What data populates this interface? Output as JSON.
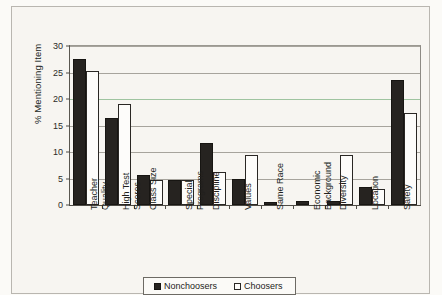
{
  "chart_data": {
    "type": "bar",
    "title": "",
    "xlabel": "",
    "ylabel": "% Mentioning Item",
    "ylim": [
      0,
      30
    ],
    "ytick_labels": [
      "0",
      "5",
      "10",
      "15",
      "20",
      "25",
      "30"
    ],
    "ytick_values": [
      0,
      5,
      10,
      15,
      20,
      25,
      30
    ],
    "grid": true,
    "legend_position": "bottom",
    "categories": [
      "Teacher Quality",
      "High Test Scores",
      "Class Size",
      "Special Programs",
      "Discipline",
      "Values",
      "Same Race",
      "Economic Background",
      "Diversity",
      "Location",
      "Safety"
    ],
    "category_lines": [
      [
        "Teacher",
        "Quality"
      ],
      [
        "High Test",
        "Scores"
      ],
      [
        "Class Size"
      ],
      [
        "Special",
        "Programs"
      ],
      [
        "Discipline"
      ],
      [
        "Values"
      ],
      [
        "Same Race"
      ],
      [
        "Economic",
        "Background"
      ],
      [
        "Diversity"
      ],
      [
        "Location"
      ],
      [
        "Safety"
      ]
    ],
    "series": [
      {
        "name": "Nonchoosers",
        "color": "#262320",
        "values": [
          27.5,
          16.5,
          5.7,
          4.8,
          11.7,
          5.0,
          0.5,
          0.7,
          0.7,
          3.4,
          23.5
        ]
      },
      {
        "name": "Choosers",
        "color": "#fdfcfa",
        "values": [
          25.3,
          19.0,
          4.7,
          4.7,
          6.3,
          9.5,
          0.0,
          0.0,
          9.5,
          3.1,
          17.3
        ]
      }
    ]
  }
}
